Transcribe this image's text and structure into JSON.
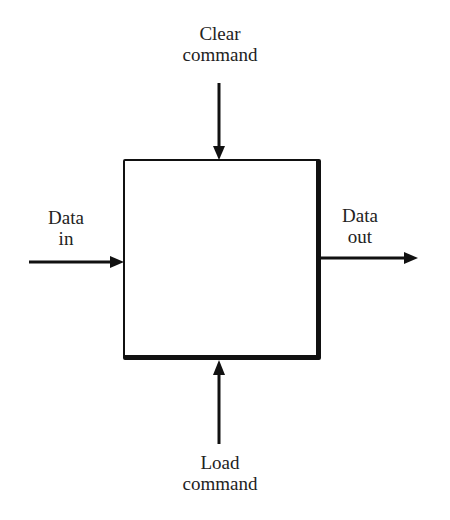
{
  "diagram": {
    "type": "block-diagram",
    "block": {
      "label": ""
    },
    "inputs": {
      "top": {
        "line1": "Clear",
        "line2": "command"
      },
      "left": {
        "line1": "Data",
        "line2": "in"
      },
      "bottom": {
        "line1": "Load",
        "line2": "command"
      }
    },
    "outputs": {
      "right": {
        "line1": "Data",
        "line2": "out"
      }
    },
    "colors": {
      "stroke": "#111111",
      "text": "#222222",
      "background": "#ffffff"
    }
  }
}
